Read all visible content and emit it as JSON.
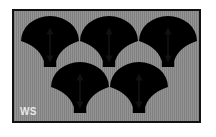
{
  "figure": {
    "kind": "schematic-diagram",
    "caption_label": "WS",
    "panel": {
      "background_color": "#8a8a8a",
      "hatch_color": "#949494",
      "border_color": "#111111",
      "border_width_px": 2,
      "x": 12,
      "y": 9,
      "width": 189,
      "height": 114
    },
    "domains": {
      "count": 5,
      "fill_color": "#ffffff",
      "outline_color": "#111111",
      "arrow_color": "#111111",
      "arrow_type": "double-headed-vertical",
      "rows": [
        {
          "row": 1,
          "count": 3
        },
        {
          "row": 2,
          "count": 2
        }
      ],
      "items": [
        {
          "id": "domain-1",
          "row": 1,
          "cx": 46,
          "cy": 42,
          "rx": 30,
          "ry": 26,
          "arrow_top": 26,
          "arrow_bottom": 56
        },
        {
          "id": "domain-2",
          "row": 1,
          "cx": 105,
          "cy": 42,
          "rx": 30,
          "ry": 26,
          "arrow_top": 26,
          "arrow_bottom": 56
        },
        {
          "id": "domain-3",
          "row": 1,
          "cx": 166,
          "cy": 42,
          "rx": 30,
          "ry": 26,
          "arrow_top": 26,
          "arrow_bottom": 56
        },
        {
          "id": "domain-4",
          "row": 2,
          "cx": 76,
          "cy": 90,
          "rx": 30,
          "ry": 26,
          "arrow_top": 74,
          "arrow_bottom": 104
        },
        {
          "id": "domain-5",
          "row": 2,
          "cx": 137,
          "cy": 90,
          "rx": 30,
          "ry": 26,
          "arrow_top": 74,
          "arrow_bottom": 104
        }
      ]
    }
  }
}
